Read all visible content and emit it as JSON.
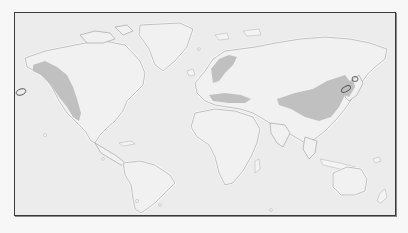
{
  "map": {
    "type": "world distribution map",
    "projection": "equirectangular",
    "colors": {
      "ocean": "#ececec",
      "land": "#f1f1f1",
      "coastline": "#9a9a9a",
      "range_fill": "#bdbdbd",
      "frame": "#3a3a3a",
      "marker_outline": "#555555"
    },
    "shaded_regions": [
      "western-north-america",
      "scandinavia",
      "mediterranean-europe",
      "central-asia-china",
      "northeast-asia-korea",
      "japan"
    ],
    "outlined_markers": [
      "aleutian-islands",
      "northern-japan-1",
      "northern-japan-2"
    ]
  }
}
